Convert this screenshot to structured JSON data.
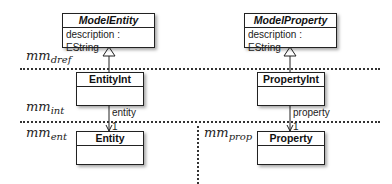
{
  "classes": {
    "model_entity": {
      "name": "ModelEntity",
      "attribute": "description : EString"
    },
    "entity_int": {
      "name": "EntityInt"
    },
    "entity": {
      "name": "Entity"
    },
    "model_property": {
      "name": "ModelProperty",
      "attribute": "description : EString"
    },
    "property_int": {
      "name": "PropertyInt"
    },
    "property": {
      "name": "Property"
    }
  },
  "layers": {
    "dref": {
      "base": "mm",
      "sub": "dref"
    },
    "int": {
      "base": "mm",
      "sub": "int"
    },
    "ent": {
      "base": "mm",
      "sub": "ent"
    },
    "prop": {
      "base": "mm",
      "sub": "prop"
    }
  },
  "associations": {
    "entity": {
      "role": "entity",
      "multiplicity": "1"
    },
    "property": {
      "role": "property",
      "multiplicity": "1"
    }
  }
}
